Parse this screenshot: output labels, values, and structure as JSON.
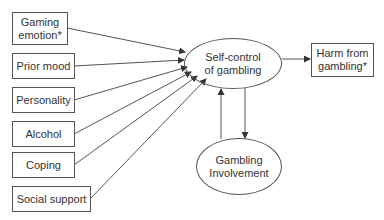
{
  "diagram": {
    "type": "path diagram",
    "nodes": [
      {
        "id": "gaming_emotion",
        "label": "Gaming\nemotion*",
        "shape": "box"
      },
      {
        "id": "prior_mood",
        "label": "Prior mood",
        "shape": "box"
      },
      {
        "id": "personality",
        "label": "Personality",
        "shape": "box"
      },
      {
        "id": "alcohol",
        "label": "Alcohol",
        "shape": "box"
      },
      {
        "id": "coping",
        "label": "Coping",
        "shape": "box"
      },
      {
        "id": "social_support",
        "label": "Social support",
        "shape": "box"
      },
      {
        "id": "self_control",
        "label": "Self-control\nof gambling",
        "shape": "ellipse"
      },
      {
        "id": "harm",
        "label": "Harm from\ngambling*",
        "shape": "box"
      },
      {
        "id": "involvement",
        "label": "Gambling\nInvolvement",
        "shape": "ellipse"
      }
    ],
    "edges": [
      {
        "from": "gaming_emotion",
        "to": "self_control"
      },
      {
        "from": "prior_mood",
        "to": "self_control"
      },
      {
        "from": "personality",
        "to": "self_control"
      },
      {
        "from": "alcohol",
        "to": "self_control"
      },
      {
        "from": "coping",
        "to": "self_control"
      },
      {
        "from": "social_support",
        "to": "self_control"
      },
      {
        "from": "self_control",
        "to": "harm"
      },
      {
        "from": "self_control",
        "to": "involvement"
      },
      {
        "from": "involvement",
        "to": "self_control"
      }
    ]
  },
  "labels": {
    "gaming_emotion": "Gaming\nemotion*",
    "prior_mood": "Prior mood",
    "personality": "Personality",
    "alcohol": "Alcohol",
    "coping": "Coping",
    "social_support": "Social support",
    "self_control": "Self-control\nof gambling",
    "harm": "Harm from\ngambling*",
    "involvement": "Gambling\nInvolvement"
  },
  "colors": {
    "stroke": "#555555",
    "text": "#333333",
    "background": "#ffffff"
  }
}
